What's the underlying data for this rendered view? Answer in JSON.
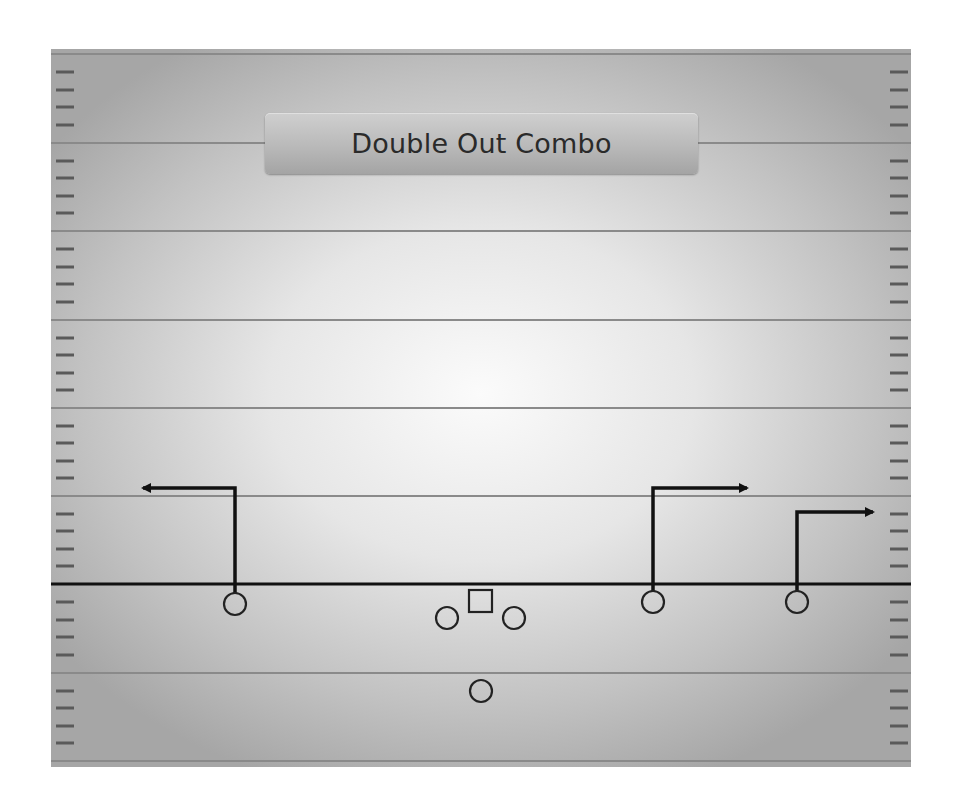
{
  "diagram": {
    "title": "Double Out Combo",
    "type": "football-play-diagram",
    "colors": {
      "field_center": "#fbfbfb",
      "field_edge": "#a6a6a6",
      "yard_line": "#8a8a8a",
      "hash_mark": "#5a5a5a",
      "scrimmage_line": "#111111",
      "route": "#111111",
      "player_stroke": "#222222",
      "title_text": "#2a2a2a"
    },
    "field": {
      "yard_lines_y": [
        94,
        182,
        271,
        359,
        447,
        624,
        712
      ],
      "line_of_scrimmage_y": 535,
      "hash_spacing": 17.65
    },
    "players": [
      {
        "id": "left-receiver",
        "shape": "circle",
        "x": 184,
        "y": 555
      },
      {
        "id": "left-guard",
        "shape": "circle",
        "x": 396,
        "y": 569
      },
      {
        "id": "center",
        "shape": "square",
        "x": 429,
        "y": 552
      },
      {
        "id": "right-guard",
        "shape": "circle",
        "x": 463,
        "y": 569
      },
      {
        "id": "quarterback",
        "shape": "circle",
        "x": 430,
        "y": 642
      },
      {
        "id": "right-slot-receiver",
        "shape": "circle",
        "x": 602,
        "y": 553
      },
      {
        "id": "right-outside-receiver",
        "shape": "circle",
        "x": 746,
        "y": 553
      }
    ],
    "routes": [
      {
        "id": "left-out-route",
        "player": "left-receiver",
        "direction": "left",
        "points": [
          [
            184,
            544
          ],
          [
            184,
            439
          ],
          [
            88,
            439
          ]
        ]
      },
      {
        "id": "right-slot-out-route",
        "player": "right-slot-receiver",
        "direction": "right",
        "points": [
          [
            602,
            542
          ],
          [
            602,
            439
          ],
          [
            700,
            439
          ]
        ]
      },
      {
        "id": "right-outside-out-route",
        "player": "right-outside-receiver",
        "direction": "right",
        "points": [
          [
            746,
            542
          ],
          [
            746,
            463
          ],
          [
            826,
            463
          ]
        ]
      }
    ]
  }
}
